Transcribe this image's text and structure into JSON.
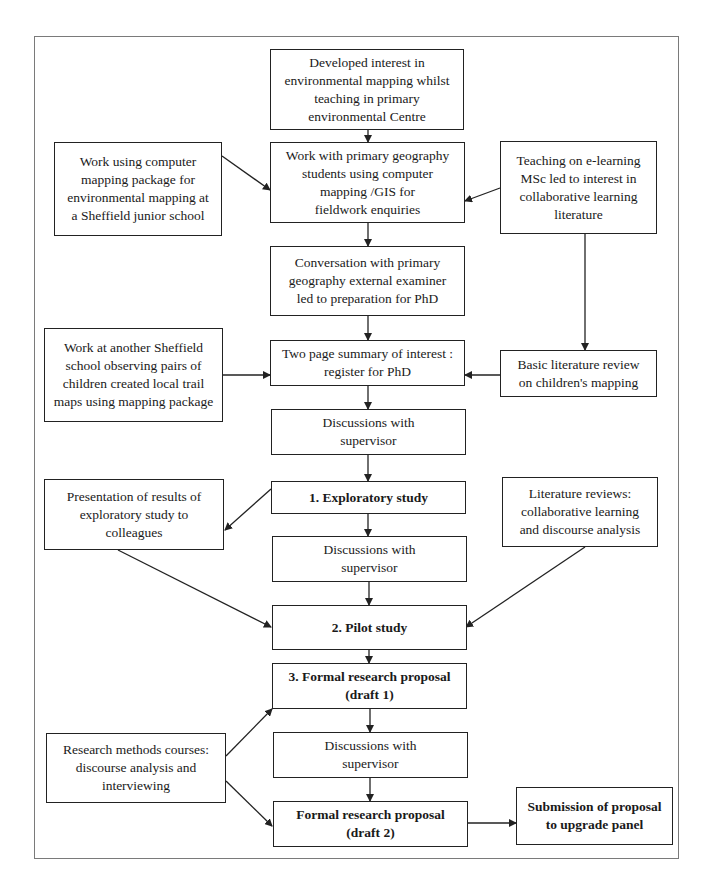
{
  "diagram": {
    "type": "flowchart",
    "nodes": {
      "n1": {
        "text": "Developed interest in\nenvironmental mapping whilst\nteaching in  primary\nenvironmental Centre",
        "bold": false
      },
      "n2": {
        "text": "Work with primary geography\nstudents using computer\nmapping /GIS for\nfieldwork enquiries",
        "bold": false
      },
      "l1": {
        "text": "Work using computer\nmapping package for\nenvironmental mapping at\na Sheffield junior school",
        "bold": false
      },
      "r1": {
        "text": "Teaching on e-learning\nMSc led to interest in\ncollaborative learning\nliterature",
        "bold": false
      },
      "n3": {
        "text": "Conversation with primary\ngeography external examiner\nled to preparation for PhD",
        "bold": false
      },
      "l2": {
        "text": "Work at another Sheffield\nschool observing pairs of\nchildren created local trail\nmaps using mapping package",
        "bold": false
      },
      "n4": {
        "text": "Two page summary of interest :\nregister for PhD",
        "bold": false
      },
      "r2": {
        "text": "Basic literature review\non children's mapping",
        "bold": false
      },
      "n5": {
        "text": "Discussions with\nsupervisor",
        "bold": false
      },
      "l3": {
        "text": "Presentation of results of\nexploratory study to\ncolleagues",
        "bold": false
      },
      "n6": {
        "text": "1. Exploratory study",
        "bold": true
      },
      "r3": {
        "text": "Literature reviews:\ncollaborative learning\nand discourse analysis",
        "bold": false
      },
      "n7": {
        "text": "Discussions with\nsupervisor",
        "bold": false
      },
      "n8": {
        "text": "2. Pilot study",
        "bold": true
      },
      "n9": {
        "text": "3. Formal research proposal\n(draft 1)",
        "bold": true
      },
      "l4": {
        "text": "Research methods courses:\ndiscourse analysis and\ninterviewing",
        "bold": false
      },
      "n10": {
        "text": "Discussions with\nsupervisor",
        "bold": false
      },
      "n11": {
        "text": "Formal research proposal\n(draft 2)",
        "bold": true
      },
      "n12": {
        "text": "Submission of proposal\nto upgrade panel",
        "bold": true
      }
    },
    "edges": [
      {
        "from": "n1",
        "to": "n2"
      },
      {
        "from": "l1",
        "to": "n2"
      },
      {
        "from": "r1",
        "to": "n2"
      },
      {
        "from": "n2",
        "to": "n3"
      },
      {
        "from": "r1",
        "to": "r2"
      },
      {
        "from": "n3",
        "to": "n4"
      },
      {
        "from": "l2",
        "to": "n4"
      },
      {
        "from": "r2",
        "to": "n4"
      },
      {
        "from": "n4",
        "to": "n5"
      },
      {
        "from": "n5",
        "to": "n6"
      },
      {
        "from": "n6",
        "to": "l3"
      },
      {
        "from": "n6",
        "to": "n7"
      },
      {
        "from": "n7",
        "to": "n8"
      },
      {
        "from": "l3",
        "to": "n8"
      },
      {
        "from": "r3",
        "to": "n8"
      },
      {
        "from": "n8",
        "to": "n9"
      },
      {
        "from": "l4",
        "to": "n9"
      },
      {
        "from": "n9",
        "to": "n10"
      },
      {
        "from": "n10",
        "to": "n11"
      },
      {
        "from": "l4",
        "to": "n11"
      },
      {
        "from": "n11",
        "to": "n12"
      }
    ]
  }
}
